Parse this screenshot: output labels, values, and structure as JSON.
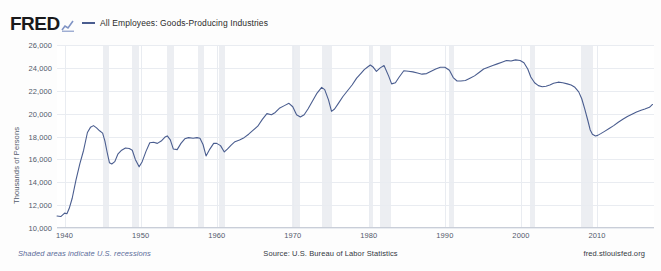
{
  "brand": {
    "logo_text": "FRED",
    "logo_mark_icon": "mini-line-chart-icon"
  },
  "legend": {
    "dash_icon": "legend-line-swatch",
    "entries": [
      {
        "label": "All Employees: Goods-Producing Industries",
        "color": "#4a5d8f"
      }
    ]
  },
  "footer": {
    "left_note": "Shaded areas indicate U.S. recessions",
    "source": "Source: U.S. Bureau of Labor Statistics",
    "site": "fred.stlouisfed.org"
  },
  "chart_data": {
    "type": "line",
    "title": "",
    "subtitle": "",
    "xlabel": "",
    "ylabel": "Thousands of Persons",
    "xlim": [
      1939,
      2017.5
    ],
    "ylim": [
      10000,
      26000
    ],
    "yticks": [
      10000,
      12000,
      14000,
      16000,
      18000,
      20000,
      22000,
      24000,
      26000
    ],
    "ytick_labels": [
      "10,000",
      "12,000",
      "14,000",
      "16,000",
      "18,000",
      "20,000",
      "22,000",
      "24,000",
      "26,000"
    ],
    "xticks": [
      1940,
      1950,
      1960,
      1970,
      1980,
      1990,
      2000,
      2010
    ],
    "xtick_labels": [
      "1940",
      "1950",
      "1960",
      "1970",
      "1980",
      "1990",
      "2000",
      "2010"
    ],
    "grid": true,
    "legend_position": "top",
    "line_color": "#4a5d8f",
    "line_width": 1.1,
    "recession_color": "#eceef2",
    "recession_bands": [
      [
        1945.1,
        1945.8
      ],
      [
        1948.9,
        1949.8
      ],
      [
        1953.5,
        1954.4
      ],
      [
        1957.6,
        1958.3
      ],
      [
        1960.3,
        1961.1
      ],
      [
        1969.9,
        1970.9
      ],
      [
        1973.9,
        1975.2
      ],
      [
        1980.0,
        1980.6
      ],
      [
        1981.5,
        1982.9
      ],
      [
        1990.5,
        1991.2
      ],
      [
        2001.2,
        2001.9
      ],
      [
        2007.9,
        2009.5
      ]
    ],
    "series": [
      {
        "name": "All Employees: Goods-Producing Industries",
        "x": [
          1939.0,
          1939.5,
          1940.0,
          1940.3,
          1940.6,
          1941.0,
          1941.5,
          1942.0,
          1942.5,
          1943.0,
          1943.4,
          1943.8,
          1944.2,
          1944.6,
          1945.0,
          1945.3,
          1945.6,
          1945.9,
          1946.2,
          1946.6,
          1947.0,
          1947.5,
          1948.0,
          1948.5,
          1948.9,
          1949.3,
          1949.8,
          1950.2,
          1950.7,
          1951.2,
          1951.7,
          1952.2,
          1952.7,
          1953.2,
          1953.5,
          1953.9,
          1954.3,
          1954.8,
          1955.3,
          1955.8,
          1956.3,
          1956.9,
          1957.4,
          1957.8,
          1958.2,
          1958.6,
          1959.1,
          1959.6,
          1960.0,
          1960.5,
          1961.0,
          1961.4,
          1961.9,
          1962.4,
          1963.0,
          1963.6,
          1964.2,
          1964.8,
          1965.4,
          1966.0,
          1966.6,
          1967.2,
          1967.7,
          1968.3,
          1968.9,
          1969.5,
          1970.0,
          1970.5,
          1971.0,
          1971.5,
          1972.0,
          1972.6,
          1973.2,
          1973.8,
          1974.2,
          1974.7,
          1975.1,
          1975.5,
          1976.0,
          1976.6,
          1977.2,
          1977.8,
          1978.4,
          1979.0,
          1979.4,
          1979.8,
          1980.2,
          1980.6,
          1981.0,
          1981.5,
          1982.0,
          1982.6,
          1983.0,
          1983.5,
          1984.0,
          1984.6,
          1985.2,
          1985.8,
          1986.4,
          1987.0,
          1987.6,
          1988.2,
          1988.8,
          1989.4,
          1990.0,
          1990.6,
          1991.1,
          1991.6,
          1992.1,
          1992.7,
          1993.3,
          1993.9,
          1994.5,
          1995.1,
          1995.7,
          1996.3,
          1996.9,
          1997.5,
          1998.1,
          1998.7,
          1999.3,
          1999.9,
          2000.4,
          2000.9,
          2001.3,
          2001.8,
          2002.3,
          2002.8,
          2003.3,
          2003.8,
          2004.3,
          2004.9,
          2005.5,
          2006.1,
          2006.6,
          2007.1,
          2007.6,
          2008.0,
          2008.4,
          2008.8,
          2009.1,
          2009.4,
          2009.8,
          2010.1,
          2010.5,
          2011.0,
          2011.6,
          2012.2,
          2012.8,
          2013.4,
          2014.0,
          2014.6,
          2015.2,
          2015.8,
          2016.3,
          2016.9,
          2017.3
        ],
        "y": [
          11050,
          11000,
          11300,
          11250,
          11700,
          12600,
          14200,
          15600,
          16800,
          18350,
          18800,
          18950,
          18750,
          18500,
          18300,
          17600,
          16600,
          15700,
          15600,
          15800,
          16450,
          16800,
          17000,
          16950,
          16800,
          16000,
          15350,
          15800,
          16700,
          17450,
          17500,
          17400,
          17600,
          17950,
          18050,
          17700,
          16900,
          16850,
          17400,
          17800,
          17900,
          17850,
          17900,
          17850,
          17300,
          16300,
          16900,
          17400,
          17400,
          17200,
          16650,
          16900,
          17250,
          17550,
          17700,
          17900,
          18200,
          18550,
          18900,
          19500,
          20000,
          19900,
          20100,
          20500,
          20700,
          20900,
          20600,
          19900,
          19700,
          19900,
          20400,
          21100,
          21800,
          22300,
          22100,
          21200,
          20200,
          20400,
          20900,
          21500,
          22000,
          22500,
          23100,
          23550,
          23850,
          24050,
          24250,
          24050,
          23700,
          24000,
          24200,
          23300,
          22600,
          22700,
          23200,
          23750,
          23700,
          23650,
          23550,
          23450,
          23500,
          23700,
          23900,
          24050,
          24050,
          23800,
          23150,
          22850,
          22850,
          22900,
          23100,
          23300,
          23600,
          23900,
          24050,
          24200,
          24350,
          24500,
          24650,
          24600,
          24700,
          24650,
          24450,
          23900,
          23200,
          22700,
          22450,
          22350,
          22400,
          22500,
          22650,
          22750,
          22700,
          22600,
          22500,
          22300,
          21900,
          21300,
          20400,
          19400,
          18600,
          18200,
          18050,
          18100,
          18250,
          18450,
          18700,
          18950,
          19250,
          19500,
          19750,
          19950,
          20150,
          20300,
          20400,
          20550,
          20800
        ]
      }
    ]
  }
}
